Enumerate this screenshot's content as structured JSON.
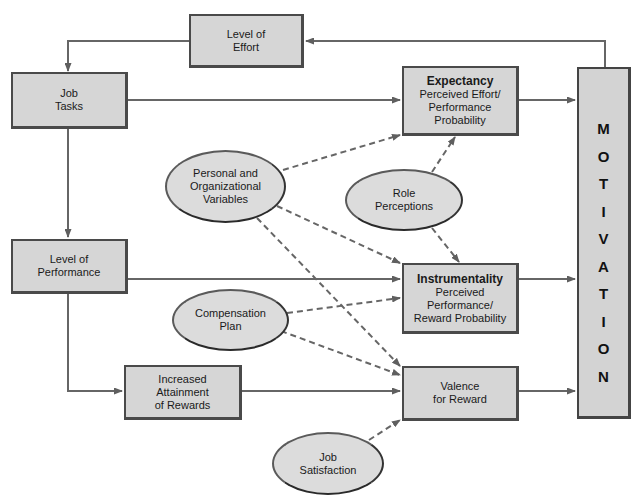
{
  "diagram": {
    "type": "flow-diagram",
    "colors": {
      "box_fill": "#d6d6d6",
      "box_border": "#4a4a4a",
      "ellipse_fill": "#dcdcdc",
      "arrow": "#5f5f5f",
      "background": "#ffffff"
    },
    "boxes": {
      "level_of_effort": {
        "lines": [
          "Level of",
          "Effort"
        ]
      },
      "job_tasks": {
        "lines": [
          "Job",
          "Tasks"
        ]
      },
      "level_of_performance": {
        "lines": [
          "Level of",
          "Performance"
        ]
      },
      "increased_attainment": {
        "lines": [
          "Increased",
          "Attainment",
          "of Rewards"
        ]
      },
      "expectancy": {
        "title": "Expectancy",
        "lines": [
          "Perceived Effort/",
          "Performance",
          "Probability"
        ]
      },
      "instrumentality": {
        "title": "Instrumentality",
        "lines": [
          "Perceived",
          "Performance/",
          "Reward Probability"
        ]
      },
      "valence": {
        "lines": [
          "Valence",
          "for Reward"
        ]
      }
    },
    "ellipses": {
      "personal_org": {
        "lines": [
          "Personal and",
          "Organizational",
          "Variables"
        ]
      },
      "role_perceptions": {
        "lines": [
          "Role",
          "Perceptions"
        ]
      },
      "compensation_plan": {
        "lines": [
          "Compensation",
          "Plan"
        ]
      },
      "job_satisfaction": {
        "lines": [
          "Job",
          "Satisfaction"
        ]
      }
    },
    "motivation": {
      "label": "MOTIVATION",
      "letters": [
        "M",
        "O",
        "T",
        "I",
        "V",
        "A",
        "T",
        "I",
        "O",
        "N"
      ]
    },
    "edges": [
      {
        "from": "Motivation",
        "to": "Level of Effort",
        "style": "solid"
      },
      {
        "from": "Level of Effort",
        "to": "Job Tasks",
        "style": "solid"
      },
      {
        "from": "Job Tasks",
        "to": "Expectancy",
        "style": "solid"
      },
      {
        "from": "Job Tasks",
        "to": "Level of Performance",
        "style": "solid"
      },
      {
        "from": "Level of Performance",
        "to": "Instrumentality",
        "style": "solid"
      },
      {
        "from": "Level of Performance",
        "to": "Increased Attainment of Rewards",
        "style": "solid"
      },
      {
        "from": "Increased Attainment of Rewards",
        "to": "Valence for Reward",
        "style": "solid"
      },
      {
        "from": "Expectancy",
        "to": "Motivation",
        "style": "solid"
      },
      {
        "from": "Instrumentality",
        "to": "Motivation",
        "style": "solid"
      },
      {
        "from": "Valence for Reward",
        "to": "Motivation",
        "style": "solid"
      },
      {
        "from": "Personal and Organizational Variables",
        "to": "Expectancy",
        "style": "dashed"
      },
      {
        "from": "Personal and Organizational Variables",
        "to": "Instrumentality",
        "style": "dashed"
      },
      {
        "from": "Personal and Organizational Variables",
        "to": "Valence for Reward",
        "style": "dashed"
      },
      {
        "from": "Role Perceptions",
        "to": "Expectancy",
        "style": "dashed"
      },
      {
        "from": "Role Perceptions",
        "to": "Instrumentality",
        "style": "dashed"
      },
      {
        "from": "Compensation Plan",
        "to": "Instrumentality",
        "style": "dashed"
      },
      {
        "from": "Compensation Plan",
        "to": "Valence for Reward",
        "style": "dashed"
      },
      {
        "from": "Job Satisfaction",
        "to": "Valence for Reward",
        "style": "dashed"
      }
    ]
  }
}
